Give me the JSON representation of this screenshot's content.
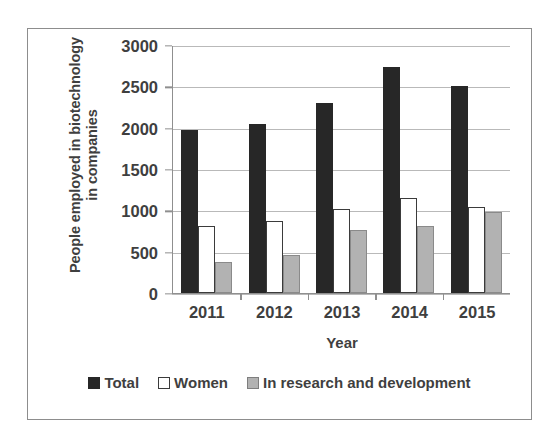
{
  "chart_data": {
    "type": "bar",
    "title": "",
    "subtitle": "",
    "xlabel": "Year",
    "ylabel": "People employed in biotechnology in companies",
    "ylabel_lines": [
      "People employed in biotechnology",
      "in companies"
    ],
    "categories": [
      "2011",
      "2012",
      "2013",
      "2014",
      "2015"
    ],
    "series": [
      {
        "name": "Total",
        "values": [
          1980,
          2050,
          2310,
          2740,
          2520
        ],
        "color": "#272727"
      },
      {
        "name": "Women",
        "values": [
          820,
          870,
          1020,
          1150,
          1050
        ],
        "color": "#ffffff"
      },
      {
        "name": "In research and development",
        "values": [
          380,
          460,
          760,
          810,
          990
        ],
        "color": "#b2b2b2"
      }
    ],
    "ylim": [
      0,
      3000
    ],
    "ytick_values": [
      0,
      500,
      1000,
      1500,
      2000,
      2500,
      3000
    ],
    "ytick_labels": [
      "0",
      "500",
      "1000",
      "1500",
      "2000",
      "2500",
      "3000"
    ],
    "grid": "horizontal",
    "legend_position": "bottom"
  },
  "figure": {
    "border_color": "#8d8d8d",
    "background": "#ffffff",
    "gridline_color": "#b9b9b9",
    "axis_color": "#8f8f8f",
    "text_color": "#3f3f3f"
  }
}
